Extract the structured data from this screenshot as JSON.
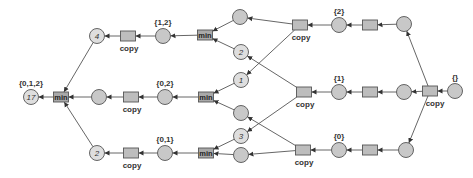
{
  "diagram": {
    "type": "petri-net-style dataflow",
    "colors": {
      "place_fill": "#c8c8c8",
      "transition_fill": "#bdbdbd",
      "min_fill": "#a9a9a9",
      "stroke": "#555555",
      "edge": "#555555"
    },
    "places": [
      {
        "id": "p_out",
        "x": 31,
        "y": 97,
        "mark": "17",
        "label": "{0,1,2}"
      },
      {
        "id": "p_top4",
        "x": 97,
        "y": 36,
        "mark": "4",
        "label": ""
      },
      {
        "id": "p_mid_a",
        "x": 99,
        "y": 97,
        "mark": "",
        "label": ""
      },
      {
        "id": "p_bot2",
        "x": 97,
        "y": 153,
        "mark": "2",
        "label": ""
      },
      {
        "id": "p_12",
        "x": 163,
        "y": 36,
        "mark": "",
        "label": "{1,2}"
      },
      {
        "id": "p_02",
        "x": 165,
        "y": 97,
        "mark": "",
        "label": "{0,2}"
      },
      {
        "id": "p_01",
        "x": 165,
        "y": 153,
        "mark": "",
        "label": "{0,1}"
      },
      {
        "id": "p_t_up",
        "x": 240,
        "y": 17,
        "mark": "",
        "label": ""
      },
      {
        "id": "p_t_dn",
        "x": 241,
        "y": 52,
        "mark": "2",
        "label": ""
      },
      {
        "id": "p_m_up",
        "x": 241,
        "y": 80,
        "mark": "1",
        "label": ""
      },
      {
        "id": "p_m_dn",
        "x": 241,
        "y": 113,
        "mark": "",
        "label": ""
      },
      {
        "id": "p_b_up",
        "x": 241,
        "y": 136,
        "mark": "3",
        "label": ""
      },
      {
        "id": "p_b_dn",
        "x": 241,
        "y": 155,
        "mark": "",
        "label": ""
      },
      {
        "id": "p_2",
        "x": 339,
        "y": 25,
        "mark": "",
        "label": "{2}"
      },
      {
        "id": "p_1",
        "x": 339,
        "y": 92,
        "mark": "",
        "label": "{1}"
      },
      {
        "id": "p_0",
        "x": 339,
        "y": 150,
        "mark": "",
        "label": "{0}"
      },
      {
        "id": "p_r_top",
        "x": 404,
        "y": 24,
        "mark": "",
        "label": ""
      },
      {
        "id": "p_r_mid",
        "x": 404,
        "y": 92,
        "mark": "",
        "label": ""
      },
      {
        "id": "p_r_bot",
        "x": 406,
        "y": 150,
        "mark": "",
        "label": ""
      },
      {
        "id": "p_in",
        "x": 455,
        "y": 91,
        "mark": "",
        "label": "{}"
      }
    ],
    "transitions": [
      {
        "id": "t_min_out",
        "x": 61,
        "y": 97,
        "kind": "min",
        "text": "min",
        "label": ""
      },
      {
        "id": "t_copy_top",
        "x": 128,
        "y": 36,
        "kind": "copy",
        "text": "",
        "label": "copy"
      },
      {
        "id": "t_copy_mid",
        "x": 131,
        "y": 97,
        "kind": "copy",
        "text": "",
        "label": "copy"
      },
      {
        "id": "t_copy_bot",
        "x": 131,
        "y": 153,
        "kind": "copy",
        "text": "",
        "label": "copy"
      },
      {
        "id": "t_min_top",
        "x": 205,
        "y": 35,
        "kind": "min",
        "text": "min",
        "label": ""
      },
      {
        "id": "t_min_mid",
        "x": 206,
        "y": 97,
        "kind": "min",
        "text": "min",
        "label": ""
      },
      {
        "id": "t_min_bot",
        "x": 206,
        "y": 153,
        "kind": "min",
        "text": "min",
        "label": ""
      },
      {
        "id": "t_c2",
        "x": 300,
        "y": 25,
        "kind": "copy",
        "text": "",
        "label": "copy"
      },
      {
        "id": "t_c1",
        "x": 304,
        "y": 92,
        "kind": "copy",
        "text": "",
        "label": "copy"
      },
      {
        "id": "t_c0",
        "x": 303,
        "y": 150,
        "kind": "copy",
        "text": "",
        "label": "copy"
      },
      {
        "id": "t_r_top",
        "x": 370,
        "y": 25,
        "kind": "plain",
        "text": "",
        "label": ""
      },
      {
        "id": "t_r_mid",
        "x": 370,
        "y": 92,
        "kind": "plain",
        "text": "",
        "label": ""
      },
      {
        "id": "t_r_bot",
        "x": 370,
        "y": 150,
        "kind": "plain",
        "text": "",
        "label": ""
      },
      {
        "id": "t_in_copy",
        "x": 430,
        "y": 91,
        "kind": "copy",
        "text": "",
        "label": "copy"
      }
    ]
  }
}
